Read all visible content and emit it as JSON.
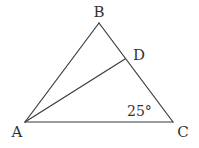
{
  "diagram": {
    "type": "triangle",
    "points": {
      "A": {
        "label": "A",
        "x": 25,
        "y": 122,
        "label_x": 17,
        "label_y": 137
      },
      "B": {
        "label": "B",
        "x": 99,
        "y": 23,
        "label_x": 99,
        "label_y": 17
      },
      "C": {
        "label": "C",
        "x": 173,
        "y": 122,
        "label_x": 183,
        "label_y": 137
      },
      "D": {
        "label": "D",
        "x": 125,
        "y": 59,
        "label_x": 139,
        "label_y": 60
      }
    },
    "segments": [
      "AB",
      "BC",
      "CA",
      "AD"
    ],
    "angle_annotation": {
      "text": "25°",
      "at_vertex": "C",
      "x": 127,
      "y": 116
    },
    "stroke_color": "#3a3a3a",
    "text_color": "#333333"
  }
}
